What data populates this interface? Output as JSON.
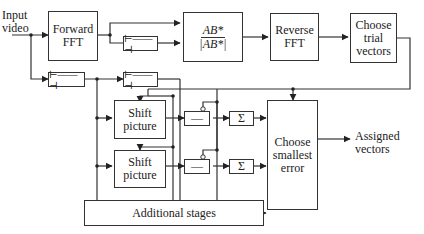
{
  "diagram": {
    "type": "block-diagram",
    "input_label": "Input\nvideo",
    "output_label": "Assigned\nvectors",
    "blocks": {
      "forward_fft": "Forward\nFFT",
      "phase_correlation_num": "AB*",
      "phase_correlation_den": "|AB*|",
      "reverse_fft": "Reverse\nFFT",
      "choose_trial_vectors": "Choose\ntrial\nvectors",
      "shift_picture_1": "Shift\npicture",
      "shift_picture_2": "Shift\npicture",
      "subtract_1": "—",
      "subtract_2": "—",
      "sum_1": "Σ",
      "sum_2": "Σ",
      "choose_smallest_error": "Choose\nsmallest\nerror",
      "additional_stages": "Additional stages"
    },
    "delay_icon": "delay-element-icon"
  }
}
